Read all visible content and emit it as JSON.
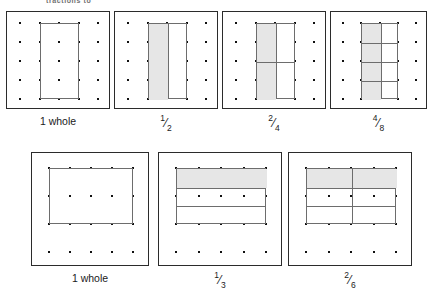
{
  "header": {
    "cropped_text": "tractions to"
  },
  "rows": [
    {
      "name": "vertical-rectangle-row",
      "cards": [
        {
          "id": "card-1-whole-vertical",
          "x": 6,
          "y": 11,
          "w": 104,
          "h": 98,
          "dots": {
            "cols": 5,
            "rows": 5,
            "pad_x": 13,
            "pad_y": 11
          },
          "figure": {
            "left_col": 1,
            "right_col": 3,
            "top_row": 0,
            "bottom_row": 4
          },
          "divisions": {
            "cols": 1,
            "rows": 1
          },
          "shaded_cells": [],
          "caption": {
            "text": "1 whole",
            "is_fraction": false,
            "numerator": "",
            "denominator": ""
          }
        },
        {
          "id": "card-one-half",
          "x": 114,
          "y": 11,
          "w": 104,
          "h": 98,
          "dots": {
            "cols": 5,
            "rows": 5,
            "pad_x": 13,
            "pad_y": 11
          },
          "figure": {
            "left_col": 1,
            "right_col": 3,
            "top_row": 0,
            "bottom_row": 4
          },
          "divisions": {
            "cols": 2,
            "rows": 1
          },
          "shaded_cells": [
            [
              0,
              0
            ]
          ],
          "caption": {
            "text": "1/2",
            "is_fraction": true,
            "numerator": "1",
            "denominator": "2"
          }
        },
        {
          "id": "card-two-fourths",
          "x": 222,
          "y": 11,
          "w": 104,
          "h": 98,
          "dots": {
            "cols": 5,
            "rows": 5,
            "pad_x": 13,
            "pad_y": 11
          },
          "figure": {
            "left_col": 1,
            "right_col": 3,
            "top_row": 0,
            "bottom_row": 4
          },
          "divisions": {
            "cols": 2,
            "rows": 2
          },
          "shaded_cells": [
            [
              0,
              0
            ],
            [
              1,
              0
            ]
          ],
          "caption": {
            "text": "2/4",
            "is_fraction": true,
            "numerator": "2",
            "denominator": "4"
          }
        },
        {
          "id": "card-four-eighths",
          "x": 330,
          "y": 11,
          "w": 97,
          "h": 98,
          "dots": {
            "cols": 5,
            "rows": 5,
            "pad_x": 12,
            "pad_y": 11
          },
          "figure": {
            "left_col": 1,
            "right_col": 3,
            "top_row": 0,
            "bottom_row": 4
          },
          "divisions": {
            "cols": 2,
            "rows": 4
          },
          "shaded_cells": [
            [
              0,
              0
            ],
            [
              1,
              0
            ],
            [
              2,
              0
            ],
            [
              3,
              0
            ]
          ],
          "caption": {
            "text": "4/8",
            "is_fraction": true,
            "numerator": "4",
            "denominator": "8"
          }
        }
      ]
    },
    {
      "name": "horizontal-rectangle-row",
      "cards": [
        {
          "id": "card-1-whole-horizontal",
          "x": 31,
          "y": 152,
          "w": 118,
          "h": 114,
          "dots": {
            "cols": 5,
            "rows": 4,
            "pad_x": 17,
            "pad_y": 15
          },
          "figure": {
            "left_col": 0,
            "right_col": 4,
            "top_row": 0,
            "bottom_row": 2
          },
          "divisions": {
            "cols": 1,
            "rows": 1
          },
          "shaded_cells": [],
          "caption": {
            "text": "1 whole",
            "is_fraction": false,
            "numerator": "",
            "denominator": ""
          }
        },
        {
          "id": "card-one-third",
          "x": 158,
          "y": 152,
          "w": 124,
          "h": 114,
          "dots": {
            "cols": 5,
            "rows": 4,
            "pad_x": 17,
            "pad_y": 15
          },
          "figure": {
            "left_col": 0,
            "right_col": 4,
            "top_row": 0,
            "bottom_row": 2
          },
          "divisions": {
            "cols": 1,
            "rows": 3
          },
          "shaded_cells": [
            [
              0,
              0
            ]
          ],
          "caption": {
            "text": "1/3",
            "is_fraction": true,
            "numerator": "1",
            "denominator": "3"
          }
        },
        {
          "id": "card-two-sixths",
          "x": 288,
          "y": 152,
          "w": 124,
          "h": 114,
          "dots": {
            "cols": 5,
            "rows": 4,
            "pad_x": 17,
            "pad_y": 15
          },
          "figure": {
            "left_col": 0,
            "right_col": 4,
            "top_row": 0,
            "bottom_row": 2
          },
          "divisions": {
            "cols": 2,
            "rows": 3
          },
          "shaded_cells": [
            [
              0,
              0
            ],
            [
              0,
              1
            ]
          ],
          "caption": {
            "text": "2/6",
            "is_fraction": true,
            "numerator": "2",
            "denominator": "6"
          }
        }
      ]
    }
  ],
  "colors": {
    "card_border": "#2b2b2b",
    "figure_line": "#6d6d6d",
    "shade_fill": "#e6e6e6",
    "dot": "#111111",
    "text": "#1a1a1a",
    "background": "#ffffff"
  }
}
